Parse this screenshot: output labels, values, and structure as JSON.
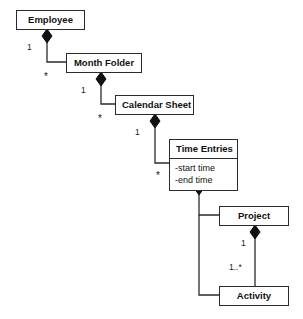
{
  "diagram": {
    "type": "uml-class-diagram",
    "title": "",
    "background_color": "#ffffff",
    "line_color": "#2b2b2b",
    "text_color": "#111111",
    "classes": [
      {
        "id": "employee",
        "name": "Employee",
        "attributes": [],
        "x": 16,
        "y": 10,
        "w": 69,
        "h": 19
      },
      {
        "id": "month-folder",
        "name": "Month Folder",
        "attributes": [],
        "x": 66,
        "y": 53,
        "w": 76,
        "h": 19
      },
      {
        "id": "calendar-sheet",
        "name": "Calendar Sheet",
        "attributes": [],
        "x": 115,
        "y": 95,
        "w": 79,
        "h": 19
      },
      {
        "id": "time-entries",
        "name": "Time Entries",
        "attributes": [
          "-start time",
          "-end time"
        ],
        "x": 169,
        "y": 139,
        "w": 69,
        "h": 42
      },
      {
        "id": "project",
        "name": "Project",
        "attributes": [],
        "x": 219,
        "y": 206,
        "w": 70,
        "h": 19
      },
      {
        "id": "activity",
        "name": "Activity",
        "attributes": [],
        "x": 219,
        "y": 286,
        "w": 70,
        "h": 19
      }
    ],
    "relations": [
      {
        "id": "employee-month-folder",
        "kind": "composition",
        "from": "employee",
        "to": "month-folder",
        "from_multiplicity": "1",
        "to_multiplicity": "*"
      },
      {
        "id": "month-folder-calendar-sheet",
        "kind": "composition",
        "from": "month-folder",
        "to": "calendar-sheet",
        "from_multiplicity": "1",
        "to_multiplicity": "*"
      },
      {
        "id": "calendar-sheet-time-entries",
        "kind": "composition",
        "from": "calendar-sheet",
        "to": "time-entries",
        "from_multiplicity": "1",
        "to_multiplicity": "*"
      },
      {
        "id": "time-entries-project",
        "kind": "composition",
        "from": "time-entries",
        "to": "project",
        "from_multiplicity": "",
        "to_multiplicity": ""
      },
      {
        "id": "time-entries-activity",
        "kind": "composition",
        "from": "time-entries",
        "to": "activity",
        "from_multiplicity": "",
        "to_multiplicity": ""
      },
      {
        "id": "project-activity",
        "kind": "composition",
        "from": "project",
        "to": "activity",
        "from_multiplicity": "1",
        "to_multiplicity": "1..*"
      }
    ],
    "multiplicity_labels": [
      {
        "id": "mult-employee-1",
        "text": "1",
        "x": 27,
        "y": 43
      },
      {
        "id": "mult-month-folder-star",
        "text": "*",
        "x": 44,
        "y": 72
      },
      {
        "id": "mult-month-folder-1",
        "text": "1",
        "x": 81,
        "y": 86
      },
      {
        "id": "mult-calendar-star",
        "text": "*",
        "x": 98,
        "y": 114
      },
      {
        "id": "mult-calendar-1",
        "text": "1",
        "x": 135,
        "y": 128
      },
      {
        "id": "mult-time-entries-star",
        "text": "*",
        "x": 156,
        "y": 171
      },
      {
        "id": "mult-project-1",
        "text": "1",
        "x": 241,
        "y": 239
      },
      {
        "id": "mult-activity-1star",
        "text": "1..*",
        "x": 229,
        "y": 263
      }
    ]
  }
}
